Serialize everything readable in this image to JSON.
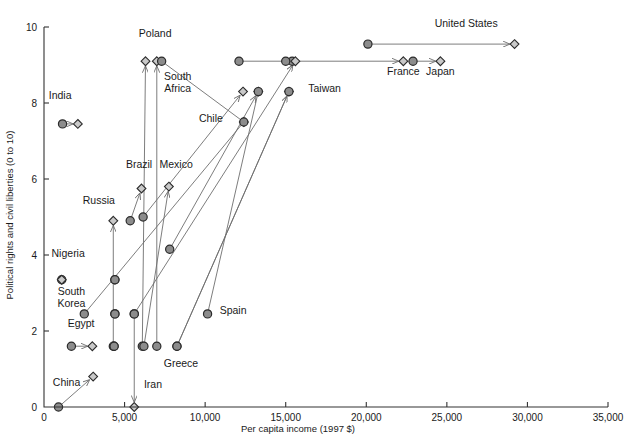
{
  "chart_data": {
    "type": "scatter",
    "title": "",
    "xlabel": "Per capita income (1997 $)",
    "ylabel": "Political rights and civil liberties (0 to 10)",
    "xlim": [
      0,
      35000
    ],
    "ylim": [
      0,
      10
    ],
    "grid": false,
    "legend": "none",
    "x_ticks": [
      {
        "value": 0,
        "label": "0"
      },
      {
        "value": 5000,
        "label": "5,000"
      },
      {
        "value": 10000,
        "label": "10,000"
      },
      {
        "value": 15000,
        "label": "15,000"
      },
      {
        "value": 20000,
        "label": "20,000"
      },
      {
        "value": 25000,
        "label": "25,000"
      },
      {
        "value": 30000,
        "label": "30,000"
      },
      {
        "value": 35000,
        "label": "35,000"
      }
    ],
    "y_ticks": [
      {
        "value": 0,
        "label": "0"
      },
      {
        "value": 2,
        "label": "2"
      },
      {
        "value": 4,
        "label": "4"
      },
      {
        "value": 6,
        "label": "6"
      },
      {
        "value": 8,
        "label": "8"
      },
      {
        "value": 10,
        "label": "10"
      }
    ],
    "marker_types": {
      "circle": "start value (earlier year)",
      "diamond": "end value (later year)"
    },
    "series": [
      {
        "name": "United States",
        "label": "United States",
        "label_x": 26200,
        "label_y": 10.0,
        "label_anchor": "middle",
        "start": {
          "x": 20100,
          "y": 9.55,
          "marker": "circle"
        },
        "end": {
          "x": 29200,
          "y": 9.55,
          "marker": "diamond"
        },
        "arrow": true
      },
      {
        "name": "France",
        "label": "France",
        "label_x": 22300,
        "label_y": 8.75,
        "label_anchor": "middle",
        "start": {
          "x": 15400,
          "y": 9.1,
          "marker": "circle"
        },
        "end": {
          "x": 22300,
          "y": 9.1,
          "marker": "diamond"
        },
        "arrow": true
      },
      {
        "name": "Japan",
        "label": "Japan",
        "label_x": 24600,
        "label_y": 8.75,
        "label_anchor": "middle",
        "start": {
          "x": 22900,
          "y": 9.1,
          "marker": "circle"
        },
        "end": {
          "x": 24600,
          "y": 9.1,
          "marker": "diamond"
        },
        "arrow": true
      },
      {
        "name": "Unlabeled high income pair",
        "label": "",
        "start": {
          "x": 12100,
          "y": 9.1,
          "marker": "circle"
        },
        "end": {
          "x": 15000,
          "y": 9.1,
          "marker": "circle"
        },
        "arrow": false
      },
      {
        "name": "Poland",
        "label": "Poland",
        "label_x": 6900,
        "label_y": 9.75,
        "label_anchor": "middle",
        "start": {
          "x": 6100,
          "y": 1.6,
          "marker": "circle"
        },
        "end": {
          "x": 6300,
          "y": 9.1,
          "marker": "diamond"
        },
        "arrow": true
      },
      {
        "name": "South Africa",
        "label": "South\nAfrica",
        "label_x": 8300,
        "label_y": 8.6,
        "label_anchor": "middle",
        "start": {
          "x": 7000,
          "y": 1.6,
          "marker": "circle"
        },
        "end": {
          "x": 7000,
          "y": 9.1,
          "marker": "diamond"
        },
        "arrow": true
      },
      {
        "name": "Chile",
        "label": "Chile",
        "label_x": 11100,
        "label_y": 7.5,
        "label_anchor": "end",
        "start": {
          "x": 7300,
          "y": 9.1,
          "marker": "circle"
        },
        "end": {
          "x": 12400,
          "y": 7.5,
          "marker": "diamond"
        },
        "arrow": false
      },
      {
        "name": "Taiwan",
        "label": "Taiwan",
        "label_x": 16400,
        "label_y": 8.3,
        "label_anchor": "start",
        "start": {
          "x": 5600,
          "y": 2.45,
          "marker": "circle"
        },
        "end": {
          "x": 15600,
          "y": 9.1,
          "marker": "diamond"
        },
        "arrow": true
      },
      {
        "name": "Taiwan mid marker",
        "label": "",
        "start": {
          "x": 8250,
          "y": 1.6,
          "marker": "circle"
        },
        "end": {
          "x": 15200,
          "y": 8.3,
          "marker": "diamond"
        },
        "arrow": true
      },
      {
        "name": "Korea growth track A",
        "label": "",
        "start": {
          "x": 6150,
          "y": 5.0,
          "marker": "circle"
        },
        "end": {
          "x": 12350,
          "y": 8.3,
          "marker": "diamond"
        },
        "arrow": true
      },
      {
        "name": "Korea growth track B",
        "label": "",
        "start": {
          "x": 7800,
          "y": 4.15,
          "marker": "circle"
        },
        "end": {
          "x": 13300,
          "y": 8.3,
          "marker": "diamond"
        },
        "arrow": true
      },
      {
        "name": "Brazil",
        "label": "Brazil",
        "label_x": 5900,
        "label_y": 6.3,
        "label_anchor": "middle",
        "start": {
          "x": 5350,
          "y": 4.9,
          "marker": "circle"
        },
        "end": {
          "x": 6050,
          "y": 5.75,
          "marker": "diamond"
        },
        "arrow": true
      },
      {
        "name": "Mexico",
        "label": "Mexico",
        "label_x": 8200,
        "label_y": 6.3,
        "label_anchor": "middle",
        "start": {
          "x": 6200,
          "y": 1.6,
          "marker": "circle"
        },
        "end": {
          "x": 7750,
          "y": 5.8,
          "marker": "diamond"
        },
        "arrow": true
      },
      {
        "name": "Russia",
        "label": "Russia",
        "label_x": 3400,
        "label_y": 5.35,
        "label_anchor": "middle",
        "start": {
          "x": 4300,
          "y": 1.6,
          "marker": "circle"
        },
        "end": {
          "x": 4300,
          "y": 4.9,
          "marker": "diamond"
        },
        "arrow": true
      },
      {
        "name": "India",
        "label": "India",
        "label_x": 1000,
        "label_y": 8.1,
        "label_anchor": "middle",
        "start": {
          "x": 1150,
          "y": 7.45,
          "marker": "circle"
        },
        "end": {
          "x": 2100,
          "y": 7.45,
          "marker": "diamond"
        },
        "arrow": true
      },
      {
        "name": "Nigeria",
        "label": "Nigeria",
        "label_x": 1500,
        "label_y": 3.95,
        "label_anchor": "middle",
        "start": {
          "x": 1100,
          "y": 3.35,
          "marker": "circle"
        },
        "end": {
          "x": 1100,
          "y": 3.35,
          "marker": "diamond"
        },
        "arrow": false
      },
      {
        "name": "South Korea",
        "label": "South\nKorea",
        "label_x": 1700,
        "label_y": 2.95,
        "label_anchor": "middle",
        "start": {
          "x": 2500,
          "y": 2.45,
          "marker": "circle"
        },
        "end": {
          "x": 12400,
          "y": 7.5,
          "marker": "circle"
        },
        "arrow": false
      },
      {
        "name": "Egypt",
        "label": "Egypt",
        "label_x": 2300,
        "label_y": 2.1,
        "label_anchor": "middle",
        "start": {
          "x": 1700,
          "y": 1.6,
          "marker": "circle"
        },
        "end": {
          "x": 3000,
          "y": 1.6,
          "marker": "diamond"
        },
        "arrow": true
      },
      {
        "name": "China",
        "label": "China",
        "label_x": 1400,
        "label_y": 0.55,
        "label_anchor": "middle",
        "start": {
          "x": 900,
          "y": 0.0,
          "marker": "circle"
        },
        "end": {
          "x": 3050,
          "y": 0.8,
          "marker": "diamond"
        },
        "arrow": true
      },
      {
        "name": "Iran",
        "label": "Iran",
        "label_x": 6200,
        "label_y": 0.5,
        "label_anchor": "start",
        "start": {
          "x": 5600,
          "y": 2.45,
          "marker": "circle"
        },
        "end": {
          "x": 5600,
          "y": 0.0,
          "marker": "diamond"
        },
        "arrow": true
      },
      {
        "name": "Greece",
        "label": "Greece",
        "label_x": 8500,
        "label_y": 1.05,
        "label_anchor": "middle",
        "start": {
          "x": 8250,
          "y": 1.6,
          "marker": "circle"
        },
        "end": {
          "x": 15200,
          "y": 8.3,
          "marker": "circle"
        },
        "arrow": false
      },
      {
        "name": "Spain",
        "label": "Spain",
        "label_x": 10900,
        "label_y": 2.45,
        "label_anchor": "start",
        "start": {
          "x": 10150,
          "y": 2.45,
          "marker": "circle"
        },
        "end": {
          "x": 13300,
          "y": 8.3,
          "marker": "circle"
        },
        "arrow": false
      },
      {
        "name": "Low income cluster A",
        "label": "",
        "start": {
          "x": 4400,
          "y": 3.35,
          "marker": "circle"
        },
        "end": {
          "x": 4400,
          "y": 3.35,
          "marker": "circle"
        },
        "arrow": false
      },
      {
        "name": "Low income cluster B",
        "label": "",
        "start": {
          "x": 4400,
          "y": 2.45,
          "marker": "circle"
        },
        "end": {
          "x": 4400,
          "y": 2.45,
          "marker": "circle"
        },
        "arrow": false
      },
      {
        "name": "Low income cluster C",
        "label": "",
        "start": {
          "x": 4350,
          "y": 1.6,
          "marker": "circle"
        },
        "end": {
          "x": 4350,
          "y": 1.6,
          "marker": "circle"
        },
        "arrow": false
      }
    ],
    "data_points": [
      {
        "label": "United States",
        "start_x": 20100,
        "start_y": 9.55,
        "end_x": 29200,
        "end_y": 9.55
      },
      {
        "label": "France",
        "start_x": 15400,
        "start_y": 9.1,
        "end_x": 22300,
        "end_y": 9.1
      },
      {
        "label": "Japan",
        "start_x": 22900,
        "start_y": 9.1,
        "end_x": 24600,
        "end_y": 9.1
      },
      {
        "label": "Poland",
        "start_x": 6100,
        "start_y": 1.6,
        "end_x": 6300,
        "end_y": 9.1
      },
      {
        "label": "South Africa",
        "start_x": 7000,
        "start_y": 1.6,
        "end_x": 7000,
        "end_y": 9.1
      },
      {
        "label": "Chile",
        "start_x": 7300,
        "start_y": 9.1,
        "end_x": 12400,
        "end_y": 7.5
      },
      {
        "label": "Taiwan",
        "start_x": 5600,
        "start_y": 2.45,
        "end_x": 15600,
        "end_y": 9.1
      },
      {
        "label": "Brazil",
        "start_x": 5350,
        "start_y": 4.9,
        "end_x": 6050,
        "end_y": 5.75
      },
      {
        "label": "Mexico",
        "start_x": 6200,
        "start_y": 1.6,
        "end_x": 7750,
        "end_y": 5.8
      },
      {
        "label": "Russia",
        "start_x": 4300,
        "start_y": 1.6,
        "end_x": 4300,
        "end_y": 4.9
      },
      {
        "label": "India",
        "start_x": 1150,
        "start_y": 7.45,
        "end_x": 2100,
        "end_y": 7.45
      },
      {
        "label": "Nigeria",
        "start_x": 1100,
        "start_y": 3.35,
        "end_x": 1100,
        "end_y": 3.35
      },
      {
        "label": "South Korea",
        "start_x": 2500,
        "start_y": 2.45,
        "end_x": 12400,
        "end_y": 7.5
      },
      {
        "label": "Egypt",
        "start_x": 1700,
        "start_y": 1.6,
        "end_x": 3000,
        "end_y": 1.6
      },
      {
        "label": "China",
        "start_x": 900,
        "start_y": 0.0,
        "end_x": 3050,
        "end_y": 0.8
      },
      {
        "label": "Iran",
        "start_x": 5600,
        "start_y": 2.45,
        "end_x": 5600,
        "end_y": 0.0
      },
      {
        "label": "Greece",
        "start_x": 8250,
        "start_y": 1.6,
        "end_x": 15200,
        "end_y": 8.3
      },
      {
        "label": "Spain",
        "start_x": 10150,
        "start_y": 2.45,
        "end_x": 13300,
        "end_y": 8.3
      }
    ]
  },
  "axes": {
    "x_title": "Per capita income (1997 $)",
    "y_title": "Political rights and civil liberties (0 to 10)"
  }
}
